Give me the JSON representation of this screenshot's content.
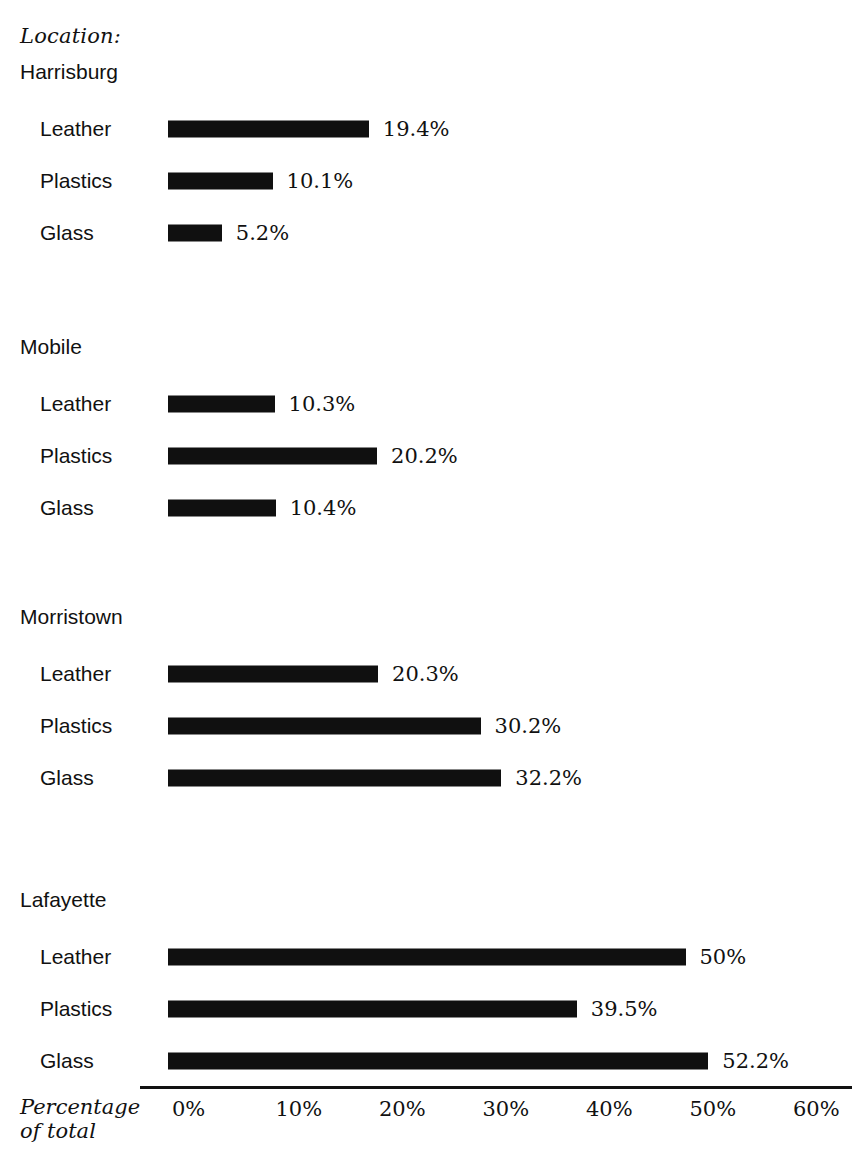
{
  "axis_title": "Location:",
  "x_axis_caption_line1": "Percentage",
  "x_axis_caption_line2": "of total",
  "colors": {
    "bar": "#101010",
    "text": "#111111",
    "background": "#ffffff"
  },
  "ticks": [
    {
      "label": "0%",
      "value": 0
    },
    {
      "label": "10%",
      "value": 10
    },
    {
      "label": "20%",
      "value": 20
    },
    {
      "label": "30%",
      "value": 30
    },
    {
      "label": "40%",
      "value": 40
    },
    {
      "label": "50%",
      "value": 50
    },
    {
      "label": "60%",
      "value": 60
    }
  ],
  "groups": [
    {
      "label": "Harrisburg",
      "rows": [
        {
          "label": "Leather",
          "value": 19.4,
          "value_label": "19.4%"
        },
        {
          "label": "Plastics",
          "value": 10.1,
          "value_label": "10.1%"
        },
        {
          "label": "Glass",
          "value": 5.2,
          "value_label": "5.2%"
        }
      ]
    },
    {
      "label": "Mobile",
      "rows": [
        {
          "label": "Leather",
          "value": 10.3,
          "value_label": "10.3%"
        },
        {
          "label": "Plastics",
          "value": 20.2,
          "value_label": "20.2%"
        },
        {
          "label": "Glass",
          "value": 10.4,
          "value_label": "10.4%"
        }
      ]
    },
    {
      "label": "Morristown",
      "rows": [
        {
          "label": "Leather",
          "value": 20.3,
          "value_label": "20.3%"
        },
        {
          "label": "Plastics",
          "value": 30.2,
          "value_label": "30.2%"
        },
        {
          "label": "Glass",
          "value": 32.2,
          "value_label": "32.2%"
        }
      ]
    },
    {
      "label": "Lafayette",
      "rows": [
        {
          "label": "Leather",
          "value": 50.0,
          "value_label": "50%"
        },
        {
          "label": "Plastics",
          "value": 39.5,
          "value_label": "39.5%"
        },
        {
          "label": "Glass",
          "value": 52.2,
          "value_label": "52.2%"
        }
      ]
    }
  ],
  "chart_data": {
    "type": "bar",
    "orientation": "horizontal",
    "title": "",
    "xlabel": "Percentage of total",
    "ylabel": "Location:",
    "xlim": [
      0,
      60
    ],
    "xticks": [
      0,
      10,
      20,
      30,
      40,
      50,
      60
    ],
    "xtick_labels": [
      "0%",
      "10%",
      "20%",
      "30%",
      "40%",
      "50%",
      "60%"
    ],
    "grid": false,
    "legend": false,
    "group_field": "Location",
    "category_field": "Material",
    "categories": [
      "Leather",
      "Plastics",
      "Glass"
    ],
    "groups": [
      "Harrisburg",
      "Mobile",
      "Morristown",
      "Lafayette"
    ],
    "series": [
      {
        "name": "Harrisburg",
        "values": [
          19.4,
          10.1,
          5.2
        ]
      },
      {
        "name": "Mobile",
        "values": [
          10.3,
          20.2,
          10.4
        ]
      },
      {
        "name": "Morristown",
        "values": [
          20.3,
          30.2,
          32.2
        ]
      },
      {
        "name": "Lafayette",
        "values": [
          50.0,
          39.5,
          52.2
        ]
      }
    ],
    "data_labels": [
      [
        "19.4%",
        "10.1%",
        "5.2%"
      ],
      [
        "10.3%",
        "20.2%",
        "10.4%"
      ],
      [
        "20.3%",
        "30.2%",
        "32.2%"
      ],
      [
        "50%",
        "39.5%",
        "52.2%"
      ]
    ]
  },
  "layout": {
    "bar_origin_x": 168,
    "px_per_percent": 10.35,
    "group_tops": [
      60,
      335,
      605,
      888
    ],
    "row_offsets": [
      52,
      104,
      156
    ],
    "row_height": 34
  }
}
